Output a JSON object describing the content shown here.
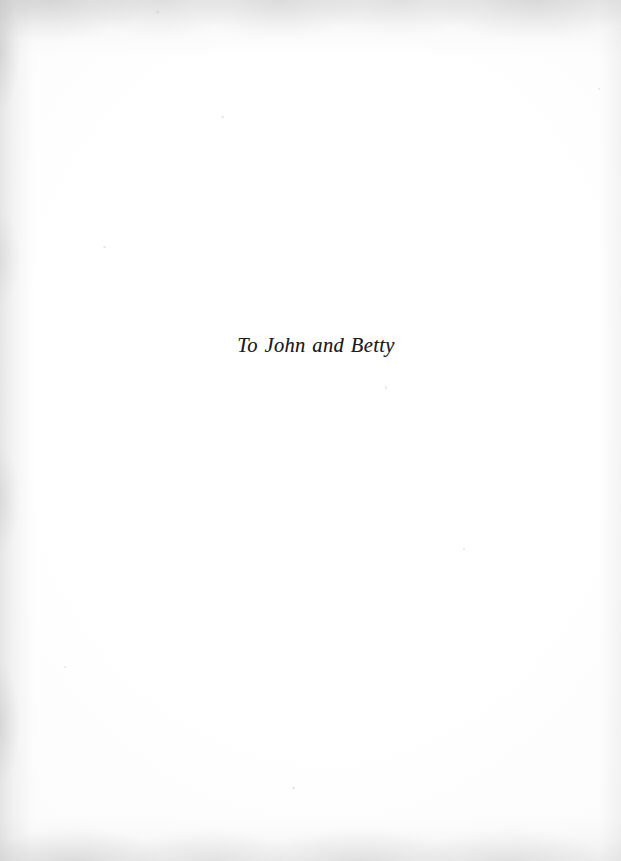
{
  "page": {
    "type": "book-dedication-page",
    "background_color": "#ffffff",
    "ink_color": "#1b1b20",
    "width": 621,
    "height": 861
  },
  "dedication": {
    "text": "To John and Betty",
    "style": "italic-serif",
    "alignment": "center",
    "font_size_px": 20.5
  },
  "artifacts": {
    "top_edge_shadow": true,
    "left_gutter_shadow": true,
    "right_edge_shadow": true,
    "bottom_edge_shadow": true,
    "paper_specks": true
  }
}
